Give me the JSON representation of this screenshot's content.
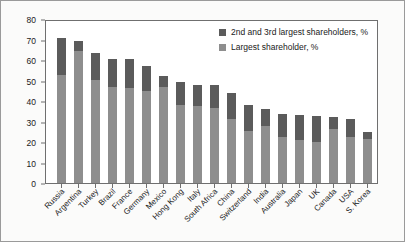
{
  "chart_data": {
    "type": "bar",
    "subtype": "stacked-vertical",
    "title": "",
    "xlabel": "",
    "ylabel": "",
    "ylim": [
      0,
      80
    ],
    "yticks": [
      0,
      10,
      20,
      30,
      40,
      50,
      60,
      70,
      80
    ],
    "grid": false,
    "legend_position": "top-right",
    "categories": [
      "Russia",
      "Argentina",
      "Turkey",
      "Brazil",
      "France",
      "Germany",
      "Mexico",
      "Hong Kong",
      "Italy",
      "South Africa",
      "China",
      "Switzerland",
      "India",
      "Australia",
      "Japan",
      "UK",
      "Canada",
      "USA",
      "S. Korea"
    ],
    "series": [
      {
        "name": "Largest shareholder, %",
        "color": "#8e8e8e",
        "values": [
          52.7,
          64.5,
          50.3,
          46.8,
          46.3,
          44.9,
          47.0,
          38.0,
          37.4,
          36.5,
          31.0,
          25.5,
          27.8,
          22.6,
          21.0,
          20.2,
          26.3,
          22.4,
          21.4
        ]
      },
      {
        "name": "2nd and 3rd largest shareholders, %",
        "color": "#5b5b5b",
        "values": [
          18.0,
          5.0,
          12.9,
          13.8,
          14.0,
          12.2,
          5.3,
          11.4,
          10.5,
          11.4,
          13.0,
          12.4,
          8.3,
          11.1,
          12.2,
          12.4,
          5.9,
          8.8,
          3.6
        ]
      }
    ],
    "totals": [
      70.7,
      69.5,
      63.2,
      60.6,
      60.3,
      57.1,
      52.3,
      49.4,
      47.9,
      47.9,
      44.0,
      37.9,
      36.1,
      33.7,
      33.2,
      32.6,
      32.2,
      31.2,
      25.0
    ]
  },
  "legend": {
    "entries": [
      {
        "label": "2nd and 3rd largest shareholders, %",
        "color": "#5b5b5b"
      },
      {
        "label": "Largest shareholder, %",
        "color": "#8e8e8e"
      }
    ]
  },
  "colors": {
    "dark_segment": "#5b5b5b",
    "light_segment": "#8e8e8e",
    "axis": "#6f6f6f",
    "text": "#1a1a1a",
    "figure_background": "#fbfbfa",
    "plot_background": "#ffffff"
  }
}
